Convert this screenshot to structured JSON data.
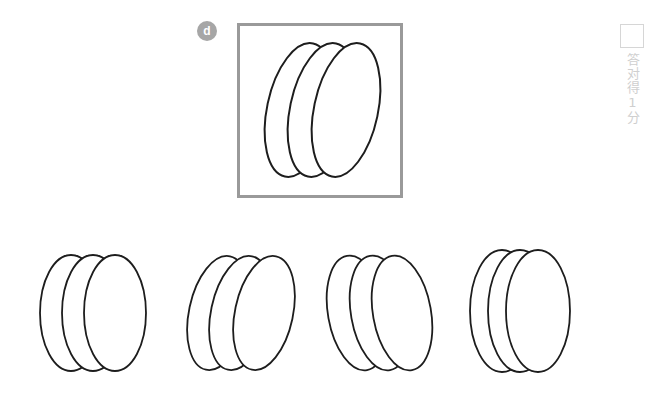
{
  "question": {
    "badge_label": "d",
    "badge_color": "#a6a6a6",
    "panel_border_color": "#9a9a9a"
  },
  "score_mark": {
    "checkbox_name": "answer-checkbox",
    "text": "答对得1分",
    "box_border_color": "#d6d6d6",
    "text_color": "#cfcfcf"
  },
  "stimulus": {
    "description": "three overlapping ellipses tilted clockwise",
    "shape_count": 3,
    "tilt_degrees": 12,
    "stroke_color": "#1d1d1d"
  },
  "options": [
    {
      "id": "option-1",
      "label": "1",
      "description": "three upright overlapping ellipses evenly spaced",
      "shape_count": 3,
      "tilt_degrees": 0
    },
    {
      "id": "option-2",
      "label": "2",
      "description": "three overlapping ellipses tilted clockwise",
      "shape_count": 3,
      "tilt_degrees": 12
    },
    {
      "id": "option-3",
      "label": "3",
      "description": "three overlapping ellipses tilted counter-clockwise",
      "shape_count": 3,
      "tilt_degrees": -12
    },
    {
      "id": "option-4",
      "label": "4",
      "description": "three upright ellipses heavily overlapping",
      "shape_count": 3,
      "tilt_degrees": 0
    }
  ],
  "colors": {
    "background": "#ffffff",
    "stroke": "#1d1d1d",
    "panel_border": "#9a9a9a",
    "badge": "#a6a6a6",
    "muted": "#cfcfcf"
  }
}
